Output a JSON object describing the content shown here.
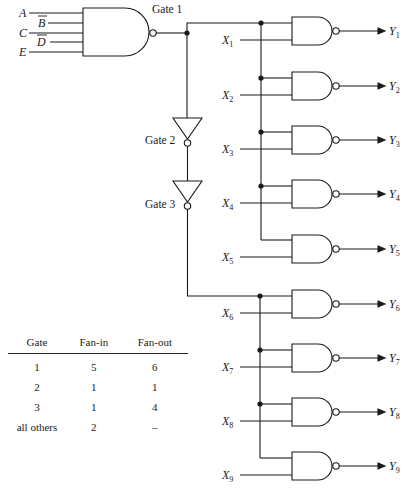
{
  "diagram": {
    "gate1": {
      "label": "Gate 1",
      "inputs": [
        {
          "name": "A",
          "overbar": false
        },
        {
          "name": "B",
          "overbar": true
        },
        {
          "name": "C",
          "overbar": false
        },
        {
          "name": "D",
          "overbar": true
        },
        {
          "name": "E",
          "overbar": false
        }
      ]
    },
    "gate2": {
      "label": "Gate 2"
    },
    "gate3": {
      "label": "Gate 3"
    },
    "nand_gates": [
      {
        "input": "X",
        "input_sub": "1",
        "output": "Y",
        "output_sub": "1"
      },
      {
        "input": "X",
        "input_sub": "2",
        "output": "Y",
        "output_sub": "2"
      },
      {
        "input": "X",
        "input_sub": "3",
        "output": "Y",
        "output_sub": "3"
      },
      {
        "input": "X",
        "input_sub": "4",
        "output": "Y",
        "output_sub": "4"
      },
      {
        "input": "X",
        "input_sub": "5",
        "output": "Y",
        "output_sub": "5"
      },
      {
        "input": "X",
        "input_sub": "6",
        "output": "Y",
        "output_sub": "6"
      },
      {
        "input": "X",
        "input_sub": "7",
        "output": "Y",
        "output_sub": "7"
      },
      {
        "input": "X",
        "input_sub": "8",
        "output": "Y",
        "output_sub": "8"
      },
      {
        "input": "X",
        "input_sub": "9",
        "output": "Y",
        "output_sub": "9"
      }
    ]
  },
  "fan_table": {
    "headers": [
      "Gate",
      "Fan-in",
      "Fan-out"
    ],
    "rows": [
      [
        "1",
        "5",
        "6"
      ],
      [
        "2",
        "1",
        "1"
      ],
      [
        "3",
        "1",
        "4"
      ],
      [
        "all others",
        "2",
        "–"
      ]
    ]
  },
  "colors": {
    "ink": "#1a1a1a",
    "background": "#ffffff"
  }
}
